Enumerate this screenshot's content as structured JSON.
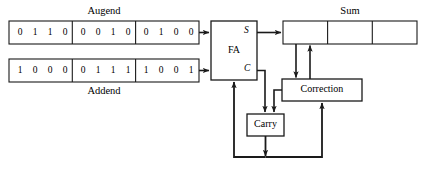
{
  "diagram": {
    "registers": {
      "augend": {
        "caption": "Augend",
        "groups": [
          [
            "0",
            "1",
            "1",
            "0"
          ],
          [
            "0",
            "0",
            "1",
            "0"
          ],
          [
            "0",
            "1",
            "0",
            "0"
          ]
        ]
      },
      "addend": {
        "caption": "Addend",
        "groups": [
          [
            "1",
            "0",
            "0",
            "0"
          ],
          [
            "0",
            "1",
            "1",
            "1"
          ],
          [
            "1",
            "0",
            "0",
            "1"
          ]
        ]
      },
      "sum": {
        "caption": "Sum",
        "groups": [
          [
            "",
            "",
            "",
            ""
          ],
          [
            "",
            "",
            "",
            ""
          ],
          [
            "",
            "",
            "",
            ""
          ]
        ]
      }
    },
    "blocks": {
      "fa": {
        "label": "FA",
        "port_sum": "S",
        "port_carry": "C"
      },
      "correction": {
        "label": "Correction"
      },
      "carry": {
        "label": "Carry"
      }
    },
    "colors": {
      "stroke": "#1a1a1a",
      "background": "#ffffff",
      "text": "#000000"
    }
  }
}
